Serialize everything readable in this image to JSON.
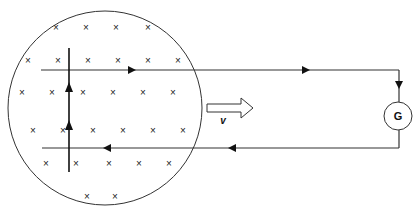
{
  "diagram": {
    "type": "electromagnetic-induction",
    "field_region": {
      "shape": "circle",
      "symbol": "×",
      "meaning": "magnetic field into page"
    },
    "field_marks": [
      [
        56,
        28
      ],
      [
        86,
        28
      ],
      [
        116,
        28
      ],
      [
        148,
        28
      ],
      [
        28,
        61
      ],
      [
        58,
        61
      ],
      [
        88,
        61
      ],
      [
        118,
        61
      ],
      [
        148,
        61
      ],
      [
        178,
        61
      ],
      [
        22,
        93
      ],
      [
        52,
        93
      ],
      [
        83,
        93
      ],
      [
        113,
        93
      ],
      [
        143,
        93
      ],
      [
        173,
        93
      ],
      [
        33,
        131
      ],
      [
        63,
        131
      ],
      [
        93,
        131
      ],
      [
        123,
        131
      ],
      [
        153,
        131
      ],
      [
        183,
        131
      ],
      [
        46,
        164
      ],
      [
        76,
        164
      ],
      [
        109,
        164
      ],
      [
        139,
        164
      ],
      [
        169,
        164
      ],
      [
        87,
        197
      ],
      [
        115,
        197
      ]
    ],
    "rod": {
      "label": "moving rod",
      "current_direction": "up"
    },
    "velocity_label": "v",
    "galvanometer_label": "G",
    "rails": {
      "upper_current": "right",
      "lower_current": "left"
    }
  }
}
